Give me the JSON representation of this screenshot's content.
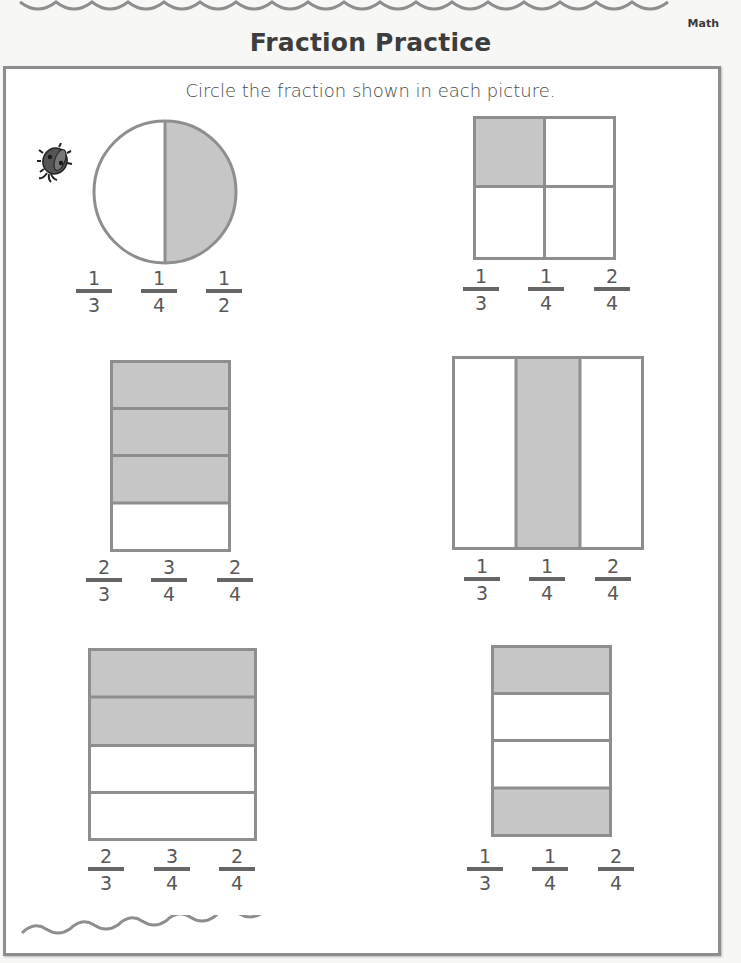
{
  "header": {
    "subject": "Math",
    "title": "Fraction Practice"
  },
  "instructions": "Circle the fraction shown in each picture.",
  "colors": {
    "shade": "#c6c6c6",
    "outline": "#8e8e8e",
    "text": "#4a4a4a",
    "fraction_bar": "#666666"
  },
  "problems": [
    {
      "id": 1,
      "shape": "circle",
      "parts": 2,
      "shaded": 1,
      "choices": [
        {
          "num": "1",
          "den": "3"
        },
        {
          "num": "1",
          "den": "4"
        },
        {
          "num": "1",
          "den": "2"
        }
      ]
    },
    {
      "id": 2,
      "shape": "square-grid-2x2",
      "parts": 4,
      "shaded": 1,
      "choices": [
        {
          "num": "1",
          "den": "3"
        },
        {
          "num": "1",
          "den": "4"
        },
        {
          "num": "2",
          "den": "4"
        }
      ]
    },
    {
      "id": 3,
      "shape": "horizontal-strips",
      "parts": 4,
      "shaded": 3,
      "choices": [
        {
          "num": "2",
          "den": "3"
        },
        {
          "num": "3",
          "den": "4"
        },
        {
          "num": "2",
          "den": "4"
        }
      ]
    },
    {
      "id": 4,
      "shape": "vertical-strips",
      "parts": 3,
      "shaded": 1,
      "choices": [
        {
          "num": "1",
          "den": "3"
        },
        {
          "num": "1",
          "den": "4"
        },
        {
          "num": "2",
          "den": "4"
        }
      ]
    },
    {
      "id": 5,
      "shape": "horizontal-strips",
      "parts": 4,
      "shaded": 2,
      "choices": [
        {
          "num": "2",
          "den": "3"
        },
        {
          "num": "3",
          "den": "4"
        },
        {
          "num": "2",
          "den": "4"
        }
      ]
    },
    {
      "id": 6,
      "shape": "horizontal-strips",
      "parts": 4,
      "shaded": 2,
      "choices": [
        {
          "num": "1",
          "den": "3"
        },
        {
          "num": "1",
          "den": "4"
        },
        {
          "num": "2",
          "den": "4"
        }
      ]
    }
  ],
  "decorations": {
    "icon": "ladybug-icon"
  }
}
